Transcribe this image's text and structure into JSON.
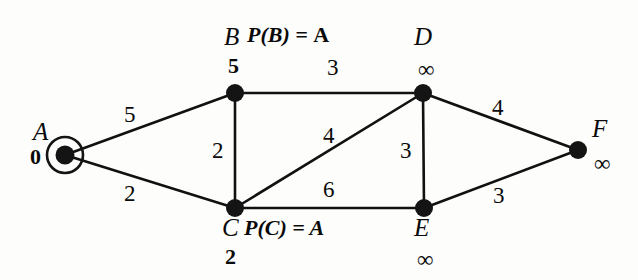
{
  "diagram": {
    "background_color": "#fdfdfb",
    "ink_color": "#111111"
  },
  "nodes": [
    {
      "id": "A",
      "name": "A",
      "distance": "0",
      "x": 65,
      "y": 155,
      "current": true,
      "name_x": 33,
      "name_y": 119,
      "dist_x": 30,
      "dist_y": 146
    },
    {
      "id": "B",
      "name": "B",
      "distance": "5",
      "x": 235,
      "y": 93,
      "current": false,
      "name_x": 224,
      "name_y": 24,
      "dist_x": 228,
      "dist_y": 55
    },
    {
      "id": "C",
      "name": "C",
      "distance": "2",
      "x": 235,
      "y": 208,
      "current": false,
      "name_x": 222,
      "name_y": 215,
      "dist_x": 225,
      "dist_y": 246
    },
    {
      "id": "D",
      "name": "D",
      "distance": "∞",
      "x": 423,
      "y": 93,
      "current": false,
      "name_x": 414,
      "name_y": 24,
      "dist_x": 418,
      "dist_y": 58
    },
    {
      "id": "E",
      "name": "E",
      "distance": "∞",
      "x": 424,
      "y": 208,
      "current": false,
      "name_x": 414,
      "name_y": 215,
      "dist_x": 417,
      "dist_y": 248
    },
    {
      "id": "F",
      "name": "F",
      "distance": "∞",
      "x": 578,
      "y": 150,
      "current": false,
      "name_x": 592,
      "name_y": 116,
      "dist_x": 594,
      "dist_y": 152
    }
  ],
  "edges": [
    {
      "from": "A",
      "to": "B",
      "weight": "5",
      "label_x": 124,
      "label_y": 103
    },
    {
      "from": "A",
      "to": "C",
      "weight": "2",
      "label_x": 124,
      "label_y": 182
    },
    {
      "from": "B",
      "to": "D",
      "weight": "3",
      "label_x": 327,
      "label_y": 56
    },
    {
      "from": "B",
      "to": "C",
      "weight": "2",
      "label_x": 212,
      "label_y": 139
    },
    {
      "from": "C",
      "to": "D",
      "weight": "4",
      "label_x": 323,
      "label_y": 124
    },
    {
      "from": "C",
      "to": "E",
      "weight": "6",
      "label_x": 323,
      "label_y": 178
    },
    {
      "from": "D",
      "to": "E",
      "weight": "3",
      "label_x": 400,
      "label_y": 139
    },
    {
      "from": "D",
      "to": "F",
      "weight": "4",
      "label_x": 492,
      "label_y": 96
    },
    {
      "from": "E",
      "to": "F",
      "weight": "3",
      "label_x": 493,
      "label_y": 184
    }
  ],
  "annotations": [
    {
      "id": "pred-b",
      "prefix": "P(B) =",
      "value": "A",
      "x": 247,
      "y": 24
    },
    {
      "id": "pred-c",
      "prefix": "P(C) =",
      "value": "A",
      "x": 244,
      "y": 217
    }
  ]
}
